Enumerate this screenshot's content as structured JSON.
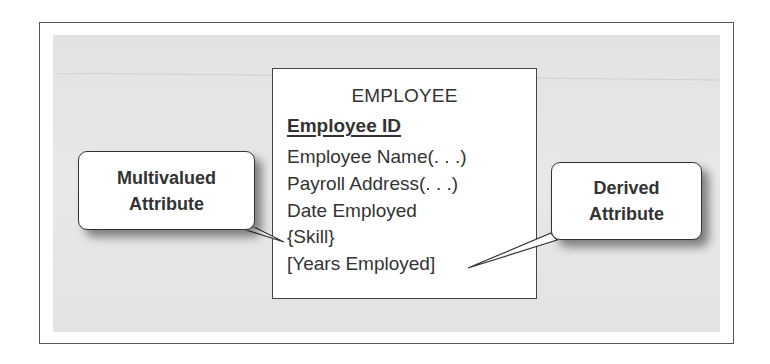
{
  "diagram": {
    "entity": {
      "name": "EMPLOYEE",
      "attributes": [
        {
          "label": "Employee ID",
          "kind": "identifier"
        },
        {
          "label": "Employee Name(. . .)",
          "kind": "composite"
        },
        {
          "label": "Payroll Address(. . .)",
          "kind": "composite"
        },
        {
          "label": "Date Employed",
          "kind": "simple"
        },
        {
          "label": "{Skill}",
          "kind": "multivalued"
        },
        {
          "label": "[Years Employed]",
          "kind": "derived"
        }
      ]
    },
    "callouts": [
      {
        "line1": "Multivalued",
        "line2": "Attribute",
        "points_to": "{Skill}"
      },
      {
        "line1": "Derived",
        "line2": "Attribute",
        "points_to": "[Years Employed]"
      }
    ],
    "colors": {
      "panel_background": "#e4e4e4",
      "border": "#444444",
      "text": "#333333",
      "box_fill": "#ffffff"
    }
  }
}
